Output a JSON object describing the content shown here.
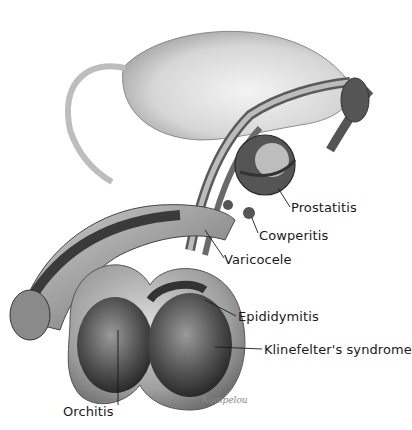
{
  "diagram": {
    "type": "anatomical-illustration",
    "labels": [
      {
        "id": "prostatitis",
        "text": "Prostatitis"
      },
      {
        "id": "cowperitis",
        "text": "Cowperitis"
      },
      {
        "id": "varicocele",
        "text": "Varicocele"
      },
      {
        "id": "epididymitis",
        "text": "Epididymitis"
      },
      {
        "id": "klinefelter",
        "text": "Klinefelter's syndrome"
      },
      {
        "id": "orchitis",
        "text": "Orchitis"
      }
    ],
    "signature": "Kompelou"
  },
  "colors": {
    "background": "#ffffff",
    "ink": "#1a1a1a",
    "tissue_dark": "#3a3a3a",
    "tissue_mid": "#8a8a8a",
    "tissue_light": "#d8d8d8"
  }
}
